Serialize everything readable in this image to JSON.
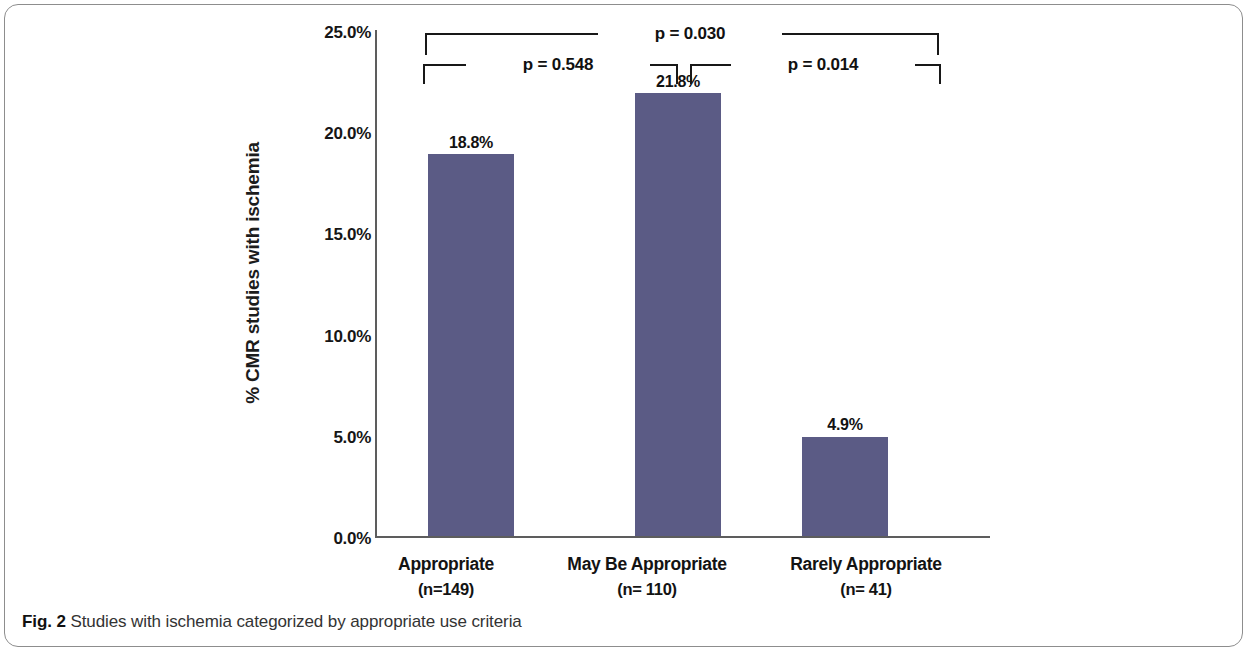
{
  "figure": {
    "caption_label": "Fig. 2",
    "caption_text": "Studies with ischemia categorized by appropriate use criteria"
  },
  "colors": {
    "bar": "#5b5b85",
    "axis": "#5d5d5d",
    "text": "#131313",
    "bracket": "#181818"
  },
  "chart_data": {
    "type": "bar",
    "title": "",
    "subtitle": "",
    "xlabel": "",
    "ylabel": "% CMR studies with ischemia",
    "categories": [
      "Appropriate",
      "May Be Appropriate",
      "Rarely Appropriate"
    ],
    "category_counts": [
      "(n=149)",
      "(n= 110)",
      "(n= 41)"
    ],
    "values": [
      18.8,
      21.8,
      4.9
    ],
    "value_labels": [
      "18.8%",
      "21.8%",
      "4.9%"
    ],
    "ylim": [
      0,
      25
    ],
    "ytick_values": [
      0,
      5,
      10,
      15,
      20,
      25
    ],
    "ytick_labels": [
      "0.0%",
      "5.0%",
      "10.0%",
      "15.0%",
      "20.0%",
      "25.0%"
    ],
    "grid": false,
    "legend": null,
    "annotations": [
      {
        "id": "p-appropriate-vs-rarely",
        "label": "p = 0.030",
        "from": "Appropriate",
        "to": "Rarely Appropriate",
        "p_value": 0.03
      },
      {
        "id": "p-appropriate-vs-maybe",
        "label": "p = 0.548",
        "from": "Appropriate",
        "to": "May Be Appropriate",
        "p_value": 0.548
      },
      {
        "id": "p-maybe-vs-rarely",
        "label": "p = 0.014",
        "from": "May Be Appropriate",
        "to": "Rarely Appropriate",
        "p_value": 0.014
      }
    ]
  }
}
